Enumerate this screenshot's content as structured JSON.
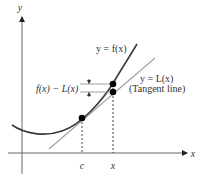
{
  "figure": {
    "axes": {
      "y_label": "y",
      "x_label": "x"
    },
    "curve": {
      "label": "y = f(x)"
    },
    "tangent": {
      "label": "y = L(x)",
      "note": "(Tangent line)"
    },
    "difference": {
      "label": "f(x) − L(x)"
    },
    "points": {
      "c_label": "c",
      "x_label": "x"
    },
    "colors": {
      "axis": "#555555",
      "curve": "#3a3a3a",
      "tangent": "#999999",
      "dot": "#000000",
      "text": "#333333"
    }
  }
}
